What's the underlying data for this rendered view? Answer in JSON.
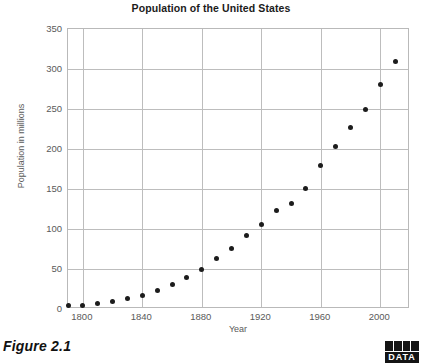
{
  "figure": {
    "caption": "Figure 2.1",
    "badge_label": "DATA",
    "badge_name": "data-badge-icon"
  },
  "chart_data": {
    "type": "scatter",
    "title": "Population of the United States",
    "xlabel": "Year",
    "ylabel": "Population in millions",
    "xlim": [
      1790,
      2020
    ],
    "ylim": [
      0,
      350
    ],
    "xticks": [
      1800,
      1840,
      1880,
      1920,
      1960,
      2000
    ],
    "yticks": [
      0,
      50,
      100,
      150,
      200,
      250,
      300,
      350
    ],
    "grid": true,
    "legend": "none",
    "marker": "filled-circle",
    "marker_color": "#1c1c1c",
    "x": [
      1790,
      1800,
      1810,
      1820,
      1830,
      1840,
      1850,
      1860,
      1870,
      1880,
      1890,
      1900,
      1910,
      1920,
      1930,
      1940,
      1950,
      1960,
      1970,
      1980,
      1990,
      2000,
      2010
    ],
    "values": [
      4,
      5,
      7,
      10,
      13,
      17,
      23,
      31,
      40,
      50,
      63,
      76,
      92,
      106,
      123,
      132,
      151,
      179,
      203,
      227,
      249,
      281,
      309
    ],
    "series": [
      {
        "name": "United States population",
        "values": [
          4,
          5,
          7,
          10,
          13,
          17,
          23,
          31,
          40,
          50,
          63,
          76,
          92,
          106,
          123,
          132,
          151,
          179,
          203,
          227,
          249,
          281,
          309
        ]
      }
    ]
  }
}
